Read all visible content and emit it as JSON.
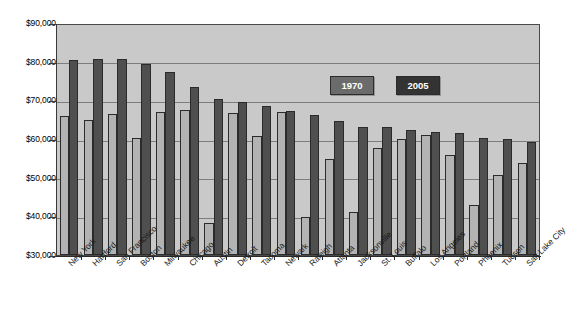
{
  "chart_data": {
    "type": "bar",
    "title": "",
    "xlabel": "",
    "ylabel": "",
    "ylim": [
      30000,
      90000
    ],
    "ytick_step": 10000,
    "grid": true,
    "legend_position": "inside-top-right",
    "ytick_labels": [
      "$90,000",
      "$80,000",
      "$70,000",
      "$60,000",
      "$50,000",
      "$40,000",
      "$30,000"
    ],
    "ytick_values": [
      90000,
      80000,
      70000,
      60000,
      50000,
      40000,
      30000
    ],
    "categories": [
      "New York",
      "Hartford",
      "San Francisco",
      "Boston",
      "Milwaukee",
      "Chicago",
      "Austin",
      "Detroit",
      "Tacoma",
      "Newark",
      "Raleigh",
      "Atlanta",
      "Jacksonville",
      "St. Louis",
      "Buffalo",
      "Los Angeles",
      "Portland",
      "Phoenix",
      "Tucson",
      "Salt Lake City"
    ],
    "series": [
      {
        "name": "1970",
        "color": "#b3b3b3",
        "values": [
          66200,
          65300,
          66800,
          60500,
          67200,
          67800,
          38300,
          67000,
          61000,
          67300,
          39900,
          55000,
          41200,
          57800,
          60200,
          61300,
          56200,
          43000,
          50900,
          54000
        ]
      },
      {
        "name": "2005",
        "color": "#4f4f4f",
        "values": [
          80900,
          81200,
          81100,
          79900,
          77700,
          73800,
          70700,
          69800,
          68800,
          67500,
          66500,
          64900,
          63400,
          63300,
          62700,
          62200,
          61800,
          60500,
          60200,
          59400
        ]
      }
    ]
  },
  "legend": {
    "items": [
      {
        "label": "1970"
      },
      {
        "label": "2005"
      }
    ]
  },
  "colors": {
    "plot_background": "#c9c9c9",
    "gridline": "#7d7d7d",
    "axis": "#2b2b2b",
    "series_1970": "#b3b3b3",
    "series_2005": "#4f4f4f",
    "page_background": "#ffffff"
  }
}
